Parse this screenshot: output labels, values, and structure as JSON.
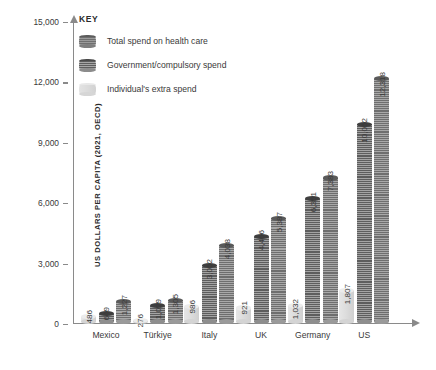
{
  "legend": {
    "title": "KEY",
    "items": [
      {
        "label": "Total spend on health care",
        "swatch": "bar-dark-striped-icon"
      },
      {
        "label": "Government/compulsory spend",
        "swatch": "bar-mid-striped-icon"
      },
      {
        "label": "Individual's extra spend",
        "swatch": "bar-light-plain-icon"
      }
    ]
  },
  "axes": {
    "y_title": "US DOLLARS PER CAPITA (2021, OECD)",
    "x_title": "COUNTRIES",
    "y_ticks": [
      "0",
      "3,000",
      "6,000",
      "9,000",
      "12,000",
      "15,000"
    ]
  },
  "chart_data": {
    "type": "bar",
    "title": "",
    "xlabel": "COUNTRIES",
    "ylabel": "US DOLLARS PER CAPITA (2021, OECD)",
    "ylim": [
      0,
      15000
    ],
    "ytick_values": [
      0,
      3000,
      6000,
      9000,
      12000,
      15000
    ],
    "grid": false,
    "legend_position": "top-left",
    "categories": [
      "Mexico",
      "Türkiye",
      "Italy",
      "UK",
      "Germany",
      "US"
    ],
    "series": [
      {
        "name": "Individual's extra spend",
        "style": "light-plain",
        "values": [
          486,
          276,
          986,
          921,
          1032,
          1807
        ],
        "labels": [
          "486",
          "276",
          "986",
          "921",
          "1,032",
          "1,807"
        ]
      },
      {
        "name": "Government/compulsory spend",
        "style": "mid-striped",
        "values": [
          649,
          1029,
          3052,
          4466,
          6351,
          10052
        ],
        "labels": [
          "649",
          "1,029",
          "3,052",
          "4,466",
          "6,351",
          "10,052"
        ]
      },
      {
        "name": "Total spend on health care",
        "style": "dark-striped",
        "values": [
          1227,
          1305,
          4038,
          5387,
          7383,
          12318
        ],
        "labels": [
          "1,227",
          "1,305",
          "4,038",
          "5,387",
          "7,383",
          "12,318"
        ]
      }
    ]
  }
}
